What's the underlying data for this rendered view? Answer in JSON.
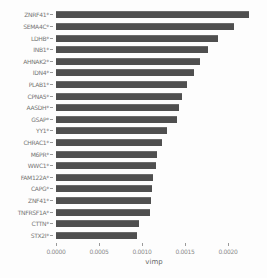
{
  "chart_data": {
    "type": "bar",
    "orientation": "horizontal",
    "title": "",
    "xlabel": "vimp",
    "ylabel": "",
    "xlim": [
      0,
      0.00245
    ],
    "x_ticks": [
      0.0,
      0.0005,
      0.001,
      0.0015,
      0.002
    ],
    "x_tick_labels": [
      "0.0000",
      "0.0005",
      "0.0010",
      "0.0015",
      "0.0020"
    ],
    "grid": false,
    "legend": "none",
    "bar_color": "#4f4f4f",
    "label_color": "#757575",
    "categories": [
      "ZNRF41*",
      "SEMA4C*",
      "LDHB*",
      "INB1*",
      "AHNAK2*",
      "IDN4*",
      "PLAB1*",
      "CPNA5*",
      "AASDH*",
      "GSAP*",
      "YY1*",
      "CHRAC1*",
      "M6PR*",
      "WWC1*",
      "FAM122A*",
      "CAPG*",
      "ZNF41*",
      "TNFRSF1A*",
      "CTTN*",
      "STX2I*"
    ],
    "values": [
      0.00224,
      0.00207,
      0.00188,
      0.00177,
      0.00167,
      0.0016,
      0.00152,
      0.00147,
      0.00143,
      0.00141,
      0.00129,
      0.00123,
      0.00117,
      0.00116,
      0.00113,
      0.00111,
      0.0011,
      0.00109,
      0.00097,
      0.00094
    ]
  },
  "axis": {
    "title": "vimp"
  },
  "layout": {
    "axis_origin_px": 56,
    "px_per_unit": 86000
  }
}
